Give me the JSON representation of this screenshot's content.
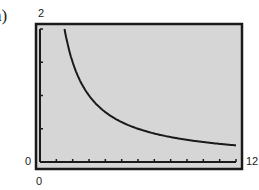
{
  "figure": {
    "part_label": "a)"
  },
  "window": {
    "xmin_label": "0",
    "xmax_label": "12",
    "ymin_label": "0",
    "ymax_label": "2"
  },
  "colors": {
    "screen_bg": "#d6d6d6",
    "frame": "#1a1a1a",
    "curve": "#1a1a1a"
  },
  "chart_data": {
    "type": "line",
    "title": "",
    "xlabel": "",
    "ylabel": "",
    "xlim": [
      0,
      12
    ],
    "ylim": [
      0,
      2
    ],
    "xscale_tick": 1,
    "yscale_tick": 0.5,
    "grid": false,
    "legend": null,
    "series": [
      {
        "name": "y = 3/x",
        "x": [
          1.5,
          1.75,
          2,
          2.5,
          3,
          3.5,
          4,
          5,
          6,
          7,
          8,
          9,
          10,
          11,
          12
        ],
        "values": [
          2.0,
          1.71,
          1.5,
          1.2,
          1.0,
          0.86,
          0.75,
          0.6,
          0.5,
          0.43,
          0.375,
          0.33,
          0.3,
          0.27,
          0.25
        ]
      }
    ]
  }
}
